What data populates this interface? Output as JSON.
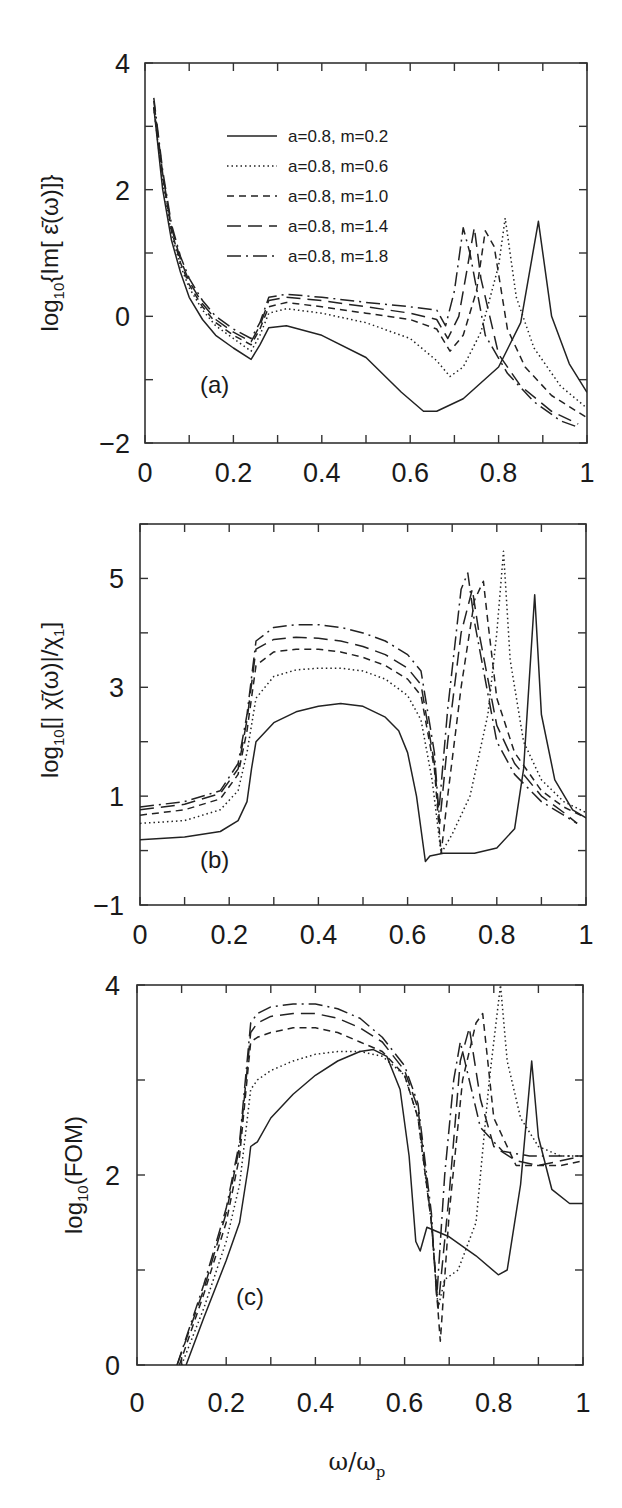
{
  "figure": {
    "panels": [
      {
        "id": "a",
        "tag": "(a)",
        "ylabel": "log10{Im[ ε̄(ω)]}"
      },
      {
        "id": "b",
        "tag": "(b)",
        "ylabel": "log10[| χ̄(ω)|/χ1]"
      },
      {
        "id": "c",
        "tag": "(c)",
        "ylabel": "log10(FOM)"
      }
    ],
    "xlabel": "ω/ωp"
  },
  "chart_data": [
    {
      "type": "line",
      "panel": "(a)",
      "title": "",
      "xlabel": "",
      "ylabel": "log10{Im[ε̄(ω)]}",
      "xlim": [
        0,
        1
      ],
      "ylim": [
        -2,
        4
      ],
      "xticks": [
        0,
        0.2,
        0.4,
        0.6,
        0.8,
        1
      ],
      "xtick_labels": [
        "0",
        "0.2",
        "0.4",
        "0.6",
        "0.8",
        "1"
      ],
      "yticks": [
        -2,
        0,
        2,
        4
      ],
      "ytick_labels": [
        "-2",
        "0",
        "2",
        "4"
      ],
      "legend": {
        "position": "upper left-center",
        "entries": [
          "a=0.8, m=0.2",
          "a=0.8, m=0.6",
          "a=0.8, m=1.0",
          "a=0.8, m=1.4",
          "a=0.8, m=1.8"
        ]
      },
      "grid": false,
      "series": [
        {
          "name": "a=0.8, m=0.2",
          "style": "solid",
          "x": [
            0.02,
            0.04,
            0.06,
            0.08,
            0.1,
            0.13,
            0.16,
            0.2,
            0.24,
            0.26,
            0.28,
            0.32,
            0.4,
            0.5,
            0.58,
            0.63,
            0.66,
            0.72,
            0.8,
            0.85,
            0.89,
            0.92,
            0.96,
            1.0
          ],
          "y": [
            3.3,
            2.0,
            1.2,
            0.7,
            0.3,
            -0.05,
            -0.3,
            -0.5,
            -0.68,
            -0.45,
            -0.18,
            -0.15,
            -0.3,
            -0.65,
            -1.2,
            -1.5,
            -1.5,
            -1.3,
            -0.8,
            -0.1,
            1.5,
            0.0,
            -0.75,
            -1.2
          ]
        },
        {
          "name": "a=0.8, m=0.6",
          "style": "dotted",
          "x": [
            0.02,
            0.04,
            0.06,
            0.08,
            0.1,
            0.13,
            0.16,
            0.2,
            0.24,
            0.26,
            0.28,
            0.32,
            0.4,
            0.5,
            0.6,
            0.66,
            0.69,
            0.72,
            0.76,
            0.8,
            0.815,
            0.84,
            0.88,
            0.94,
            1.0
          ],
          "y": [
            3.3,
            2.1,
            1.3,
            0.8,
            0.45,
            0.1,
            -0.15,
            -0.35,
            -0.55,
            -0.3,
            0.05,
            0.12,
            0.05,
            -0.1,
            -0.35,
            -0.7,
            -0.95,
            -0.8,
            -0.25,
            0.8,
            1.55,
            0.3,
            -0.5,
            -1.1,
            -1.45
          ]
        },
        {
          "name": "a=0.8, m=1.0",
          "style": "dashed",
          "x": [
            0.02,
            0.04,
            0.06,
            0.08,
            0.1,
            0.13,
            0.16,
            0.2,
            0.24,
            0.26,
            0.28,
            0.32,
            0.4,
            0.5,
            0.6,
            0.66,
            0.69,
            0.72,
            0.75,
            0.77,
            0.79,
            0.82,
            0.86,
            0.92,
            1.0
          ],
          "y": [
            3.3,
            2.2,
            1.35,
            0.85,
            0.5,
            0.15,
            -0.1,
            -0.3,
            -0.45,
            -0.2,
            0.15,
            0.22,
            0.15,
            0.05,
            -0.05,
            -0.2,
            -0.55,
            -0.3,
            0.4,
            1.35,
            1.1,
            -0.2,
            -0.8,
            -1.25,
            -1.6
          ]
        },
        {
          "name": "a=0.8, m=1.4",
          "style": "long-dash",
          "x": [
            0.02,
            0.04,
            0.06,
            0.08,
            0.1,
            0.13,
            0.16,
            0.2,
            0.24,
            0.26,
            0.28,
            0.32,
            0.4,
            0.5,
            0.6,
            0.66,
            0.685,
            0.71,
            0.73,
            0.745,
            0.76,
            0.8,
            0.85,
            0.92,
            0.98
          ],
          "y": [
            3.4,
            2.25,
            1.4,
            0.9,
            0.55,
            0.2,
            -0.05,
            -0.25,
            -0.4,
            -0.15,
            0.25,
            0.3,
            0.25,
            0.15,
            0.05,
            -0.05,
            -0.35,
            0.0,
            0.8,
            1.4,
            0.6,
            -0.6,
            -1.1,
            -1.5,
            -1.7
          ]
        },
        {
          "name": "a=0.8, m=1.8",
          "style": "dash-dot",
          "x": [
            0.02,
            0.04,
            0.06,
            0.08,
            0.1,
            0.13,
            0.16,
            0.2,
            0.24,
            0.26,
            0.28,
            0.32,
            0.4,
            0.5,
            0.6,
            0.66,
            0.68,
            0.7,
            0.72,
            0.735,
            0.77,
            0.82,
            0.88,
            0.94,
            0.98
          ],
          "y": [
            3.45,
            2.3,
            1.45,
            0.95,
            0.6,
            0.25,
            0.0,
            -0.2,
            -0.35,
            -0.1,
            0.3,
            0.35,
            0.3,
            0.22,
            0.15,
            0.1,
            -0.15,
            0.4,
            1.4,
            1.0,
            -0.3,
            -0.9,
            -1.35,
            -1.65,
            -1.75
          ]
        }
      ]
    },
    {
      "type": "line",
      "panel": "(b)",
      "title": "",
      "xlabel": "",
      "ylabel": "log10[|χ̄(ω)|/χ1]",
      "xlim": [
        0,
        1
      ],
      "ylim": [
        -1,
        6
      ],
      "xticks": [
        0,
        0.2,
        0.4,
        0.6,
        0.8,
        1
      ],
      "xtick_labels": [
        "0",
        "0.2",
        "0.4",
        "0.6",
        "0.8",
        "1"
      ],
      "yticks": [
        -1,
        1,
        3,
        5
      ],
      "ytick_labels": [
        "-1",
        "1",
        "3",
        "5"
      ],
      "grid": false,
      "series": [
        {
          "name": "a=0.8, m=0.2",
          "style": "solid",
          "x": [
            0.0,
            0.1,
            0.18,
            0.22,
            0.24,
            0.25,
            0.26,
            0.3,
            0.35,
            0.4,
            0.45,
            0.5,
            0.55,
            0.58,
            0.6,
            0.62,
            0.64,
            0.65,
            0.68,
            0.75,
            0.8,
            0.84,
            0.86,
            0.885,
            0.9,
            0.93,
            0.97,
            1.0
          ],
          "y": [
            0.2,
            0.25,
            0.35,
            0.55,
            0.9,
            1.5,
            2.0,
            2.35,
            2.55,
            2.65,
            2.7,
            2.65,
            2.45,
            2.2,
            1.8,
            1.0,
            -0.2,
            -0.1,
            -0.05,
            -0.05,
            0.05,
            0.4,
            1.5,
            4.7,
            2.5,
            1.3,
            0.75,
            0.6
          ]
        },
        {
          "name": "a=0.8, m=0.6",
          "style": "dotted",
          "x": [
            0.0,
            0.1,
            0.18,
            0.22,
            0.24,
            0.26,
            0.3,
            0.35,
            0.4,
            0.45,
            0.5,
            0.55,
            0.6,
            0.63,
            0.655,
            0.675,
            0.7,
            0.74,
            0.78,
            0.8,
            0.815,
            0.83,
            0.86,
            0.9,
            0.95,
            1.0
          ],
          "y": [
            0.5,
            0.55,
            0.75,
            1.1,
            1.8,
            2.8,
            3.2,
            3.32,
            3.35,
            3.35,
            3.3,
            3.15,
            2.85,
            2.4,
            1.3,
            -0.05,
            0.3,
            1.0,
            2.5,
            4.0,
            5.5,
            3.5,
            2.0,
            1.3,
            0.9,
            0.7
          ]
        },
        {
          "name": "a=0.8, m=1.0",
          "style": "dashed",
          "x": [
            0.0,
            0.1,
            0.18,
            0.22,
            0.24,
            0.26,
            0.3,
            0.35,
            0.4,
            0.45,
            0.5,
            0.55,
            0.6,
            0.63,
            0.66,
            0.675,
            0.69,
            0.72,
            0.75,
            0.77,
            0.78,
            0.8,
            0.84,
            0.9,
            0.95,
            1.0
          ],
          "y": [
            0.65,
            0.75,
            0.95,
            1.4,
            2.2,
            3.4,
            3.65,
            3.7,
            3.7,
            3.65,
            3.55,
            3.4,
            3.15,
            2.85,
            1.5,
            -0.05,
            1.0,
            3.0,
            4.6,
            4.95,
            4.2,
            2.8,
            1.8,
            1.1,
            0.8,
            0.6
          ]
        },
        {
          "name": "a=0.8, m=1.4",
          "style": "long-dash",
          "x": [
            0.0,
            0.1,
            0.18,
            0.22,
            0.24,
            0.26,
            0.3,
            0.35,
            0.4,
            0.45,
            0.5,
            0.55,
            0.6,
            0.63,
            0.66,
            0.672,
            0.69,
            0.72,
            0.745,
            0.76,
            0.8,
            0.84,
            0.9,
            0.95,
            0.98
          ],
          "y": [
            0.75,
            0.85,
            1.05,
            1.5,
            2.4,
            3.7,
            3.88,
            3.92,
            3.9,
            3.85,
            3.75,
            3.6,
            3.35,
            3.05,
            1.6,
            0.5,
            2.0,
            4.0,
            4.8,
            4.0,
            2.3,
            1.6,
            1.0,
            0.7,
            0.5
          ]
        },
        {
          "name": "a=0.8, m=1.8",
          "style": "dash-dot",
          "x": [
            0.0,
            0.1,
            0.18,
            0.22,
            0.24,
            0.26,
            0.3,
            0.35,
            0.4,
            0.45,
            0.5,
            0.55,
            0.6,
            0.63,
            0.66,
            0.67,
            0.69,
            0.72,
            0.735,
            0.75,
            0.8,
            0.84,
            0.9,
            0.95,
            0.98
          ],
          "y": [
            0.8,
            0.9,
            1.1,
            1.6,
            2.5,
            3.85,
            4.1,
            4.15,
            4.15,
            4.1,
            4.0,
            3.85,
            3.6,
            3.3,
            1.8,
            0.7,
            2.6,
            4.8,
            5.1,
            4.2,
            2.0,
            1.4,
            0.9,
            0.65,
            0.5
          ]
        }
      ]
    },
    {
      "type": "line",
      "panel": "(c)",
      "title": "",
      "xlabel": "ω/ωp",
      "ylabel": "log10(FOM)",
      "xlim": [
        0,
        1
      ],
      "ylim": [
        0,
        4
      ],
      "xticks": [
        0,
        0.2,
        0.4,
        0.6,
        0.8,
        1
      ],
      "xtick_labels": [
        "0",
        "0.2",
        "0.4",
        "0.6",
        "0.8",
        "1"
      ],
      "yticks": [
        0,
        2,
        4
      ],
      "ytick_labels": [
        "0",
        "2",
        "4"
      ],
      "grid": false,
      "series": [
        {
          "name": "a=0.8, m=0.2",
          "style": "solid",
          "x": [
            0.11,
            0.15,
            0.2,
            0.23,
            0.25,
            0.255,
            0.27,
            0.3,
            0.35,
            0.4,
            0.45,
            0.5,
            0.53,
            0.56,
            0.59,
            0.61,
            0.625,
            0.635,
            0.65,
            0.7,
            0.76,
            0.81,
            0.83,
            0.86,
            0.885,
            0.9,
            0.93,
            0.97,
            1.0
          ],
          "y": [
            0.0,
            0.5,
            1.1,
            1.5,
            2.1,
            2.3,
            2.35,
            2.6,
            2.85,
            3.05,
            3.2,
            3.3,
            3.32,
            3.25,
            2.9,
            2.2,
            1.3,
            1.2,
            1.45,
            1.35,
            1.15,
            0.95,
            1.0,
            1.9,
            3.2,
            2.4,
            1.85,
            1.7,
            1.7
          ]
        },
        {
          "name": "a=0.8, m=0.6",
          "style": "dotted",
          "x": [
            0.1,
            0.15,
            0.2,
            0.23,
            0.255,
            0.27,
            0.3,
            0.35,
            0.4,
            0.45,
            0.5,
            0.55,
            0.6,
            0.63,
            0.66,
            0.675,
            0.69,
            0.72,
            0.76,
            0.79,
            0.815,
            0.83,
            0.86,
            0.9,
            0.95,
            1.0
          ],
          "y": [
            0.0,
            0.6,
            1.3,
            1.9,
            2.9,
            3.0,
            3.1,
            3.2,
            3.27,
            3.3,
            3.3,
            3.25,
            3.05,
            2.6,
            1.5,
            0.6,
            0.9,
            1.0,
            1.5,
            3.0,
            4.0,
            3.2,
            2.6,
            2.3,
            2.2,
            2.2
          ]
        },
        {
          "name": "a=0.8, m=1.0",
          "style": "dashed",
          "x": [
            0.095,
            0.15,
            0.2,
            0.23,
            0.255,
            0.27,
            0.3,
            0.35,
            0.4,
            0.45,
            0.5,
            0.55,
            0.6,
            0.63,
            0.66,
            0.68,
            0.7,
            0.73,
            0.76,
            0.775,
            0.8,
            0.85,
            0.9,
            0.95,
            1.0
          ],
          "y": [
            0.0,
            0.75,
            1.5,
            2.2,
            3.4,
            3.45,
            3.5,
            3.55,
            3.55,
            3.5,
            3.4,
            3.3,
            3.05,
            2.6,
            1.5,
            0.25,
            1.6,
            3.0,
            3.6,
            3.7,
            2.6,
            2.1,
            2.1,
            2.1,
            2.15
          ]
        },
        {
          "name": "a=0.8, m=1.4",
          "style": "long-dash",
          "x": [
            0.09,
            0.15,
            0.2,
            0.23,
            0.255,
            0.27,
            0.3,
            0.35,
            0.4,
            0.45,
            0.5,
            0.55,
            0.6,
            0.63,
            0.66,
            0.675,
            0.7,
            0.725,
            0.745,
            0.77,
            0.8,
            0.85,
            0.9,
            0.95,
            1.0
          ],
          "y": [
            0.0,
            0.8,
            1.6,
            2.3,
            3.5,
            3.6,
            3.67,
            3.7,
            3.7,
            3.65,
            3.55,
            3.4,
            3.1,
            2.7,
            1.5,
            0.6,
            1.8,
            3.2,
            3.55,
            2.8,
            2.3,
            2.15,
            2.1,
            2.15,
            2.2
          ]
        },
        {
          "name": "a=0.8, m=1.8",
          "style": "dash-dot",
          "x": [
            0.09,
            0.15,
            0.2,
            0.23,
            0.255,
            0.27,
            0.3,
            0.35,
            0.4,
            0.45,
            0.5,
            0.55,
            0.6,
            0.63,
            0.66,
            0.672,
            0.69,
            0.71,
            0.725,
            0.74,
            0.77,
            0.82,
            0.88,
            0.94,
            1.0
          ],
          "y": [
            0.0,
            0.85,
            1.65,
            2.35,
            3.6,
            3.7,
            3.77,
            3.8,
            3.8,
            3.75,
            3.65,
            3.45,
            3.15,
            2.75,
            1.6,
            0.7,
            2.0,
            3.0,
            3.4,
            3.1,
            2.5,
            2.25,
            2.2,
            2.2,
            2.2
          ]
        }
      ]
    }
  ]
}
